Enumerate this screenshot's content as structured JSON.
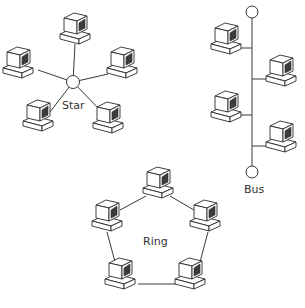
{
  "colors": {
    "line": "#3a3a3a",
    "screen": "#3c3c3c",
    "background": "#ffffff"
  },
  "labels": {
    "star": {
      "text": "Star",
      "x": 62,
      "y": 100
    },
    "bus": {
      "text": "Bus",
      "x": 244,
      "y": 184
    },
    "ring": {
      "text": "Ring",
      "x": 143,
      "y": 236
    }
  },
  "star": {
    "hub": {
      "x": 73,
      "y": 82,
      "r": 6.5
    },
    "computers": [
      {
        "name": "star-pc-top",
        "x": 75,
        "y": 28
      },
      {
        "name": "star-pc-left",
        "x": 18,
        "y": 62
      },
      {
        "name": "star-pc-right",
        "x": 122,
        "y": 62
      },
      {
        "name": "star-pc-bottom-left",
        "x": 38,
        "y": 115
      },
      {
        "name": "star-pc-bottom-right",
        "x": 108,
        "y": 117
      }
    ],
    "spokes": [
      {
        "x": 75,
        "y": 44
      },
      {
        "x": 38,
        "y": 70
      },
      {
        "x": 108,
        "y": 74
      },
      {
        "x": 50,
        "y": 112
      },
      {
        "x": 100,
        "y": 110
      }
    ]
  },
  "bus": {
    "line": {
      "x": 252,
      "y1": 18,
      "y2": 166
    },
    "terminators": [
      {
        "x": 252,
        "y": 12,
        "r": 6
      },
      {
        "x": 252,
        "y": 172,
        "r": 6
      }
    ],
    "computers": [
      {
        "name": "bus-pc-1",
        "x": 226,
        "y": 38,
        "side": "left",
        "tapY": 48
      },
      {
        "name": "bus-pc-2",
        "x": 281,
        "y": 70,
        "side": "right",
        "tapY": 79
      },
      {
        "name": "bus-pc-3",
        "x": 226,
        "y": 106,
        "side": "left",
        "tapY": 115
      },
      {
        "name": "bus-pc-4",
        "x": 281,
        "y": 136,
        "side": "right",
        "tapY": 146
      }
    ]
  },
  "ring": {
    "computers": [
      {
        "name": "ring-pc-top",
        "x": 158,
        "y": 182
      },
      {
        "name": "ring-pc-left",
        "x": 107,
        "y": 215
      },
      {
        "name": "ring-pc-right",
        "x": 205,
        "y": 215
      },
      {
        "name": "ring-pc-bottom-left",
        "x": 120,
        "y": 273
      },
      {
        "name": "ring-pc-bottom-right",
        "x": 190,
        "y": 273
      }
    ],
    "links": [
      {
        "x1": 146,
        "y1": 196,
        "x2": 120,
        "y2": 210
      },
      {
        "x1": 170,
        "y1": 196,
        "x2": 194,
        "y2": 210
      },
      {
        "x1": 107,
        "y1": 232,
        "x2": 115,
        "y2": 262
      },
      {
        "x1": 208,
        "y1": 232,
        "x2": 200,
        "y2": 262
      },
      {
        "x1": 138,
        "y1": 284,
        "x2": 176,
        "y2": 284
      }
    ]
  }
}
